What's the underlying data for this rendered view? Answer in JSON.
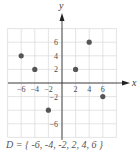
{
  "chart_data": {
    "type": "scatter",
    "title": "",
    "xlabel": "x",
    "ylabel": "y",
    "xlim": [
      -8,
      8
    ],
    "ylim": [
      -8,
      8
    ],
    "grid": true,
    "grid_step": 2,
    "x_tick_labels": [
      "-6",
      "-4",
      "-2",
      "2",
      "4",
      "6"
    ],
    "y_tick_labels": [
      "6",
      "4",
      "2",
      "-2",
      "-6"
    ],
    "series": [
      {
        "name": "points",
        "points": [
          {
            "x": -6,
            "y": 4
          },
          {
            "x": -4,
            "y": 2
          },
          {
            "x": -2,
            "y": -4
          },
          {
            "x": 2,
            "y": 2
          },
          {
            "x": 4,
            "y": 6
          },
          {
            "x": 6,
            "y": -2
          }
        ]
      }
    ],
    "colors": {
      "grid": "#d8d8d8",
      "axis": "#333333",
      "point": "#555555"
    }
  },
  "caption": "D = { -6, -4, -2, 2, 4, 6 }"
}
